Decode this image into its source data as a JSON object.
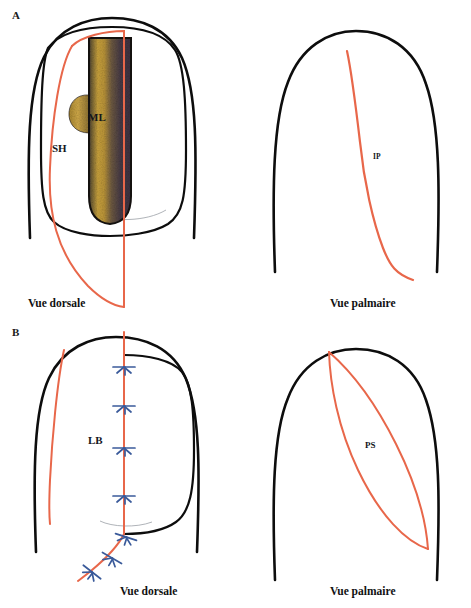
{
  "figure": {
    "background_color": "#ffffff",
    "width": 471,
    "height": 608,
    "outline_color": "#0d0d0d",
    "accent_red": "#e8674a",
    "accent_blue": "#3a5a9a",
    "texture_gold": "#c8a13a",
    "texture_dark": "#3d3040"
  },
  "panels": [
    {
      "letter": "A",
      "views": [
        {
          "name": "dorsal",
          "caption": "Vue dorsale",
          "labels": [
            {
              "key": "ML",
              "text": "ML"
            },
            {
              "key": "SH",
              "text": "SH"
            }
          ]
        },
        {
          "name": "palmar",
          "caption": "Vue palmaire",
          "labels": [
            {
              "key": "IP",
              "text": "IP"
            }
          ]
        }
      ]
    },
    {
      "letter": "B",
      "views": [
        {
          "name": "dorsal",
          "caption": "Vue dorsale",
          "labels": [
            {
              "key": "LB",
              "text": "LB"
            }
          ],
          "chevron_count": 7
        },
        {
          "name": "palmar",
          "caption": "Vue palmaire",
          "labels": [
            {
              "key": "PS",
              "text": "PS"
            }
          ]
        }
      ]
    }
  ],
  "annotations": {
    "panel_a_letter": "A",
    "panel_b_letter": "B",
    "a_dorsal_caption": "Vue dorsale",
    "a_palmar_caption": "Vue palmaire",
    "b_dorsal_caption": "Vue dorsale",
    "b_palmar_caption": "Vue palmaire",
    "label_ml": "ML",
    "label_sh": "SH",
    "label_ip": "IP",
    "label_lb": "LB",
    "label_ps": "PS"
  }
}
